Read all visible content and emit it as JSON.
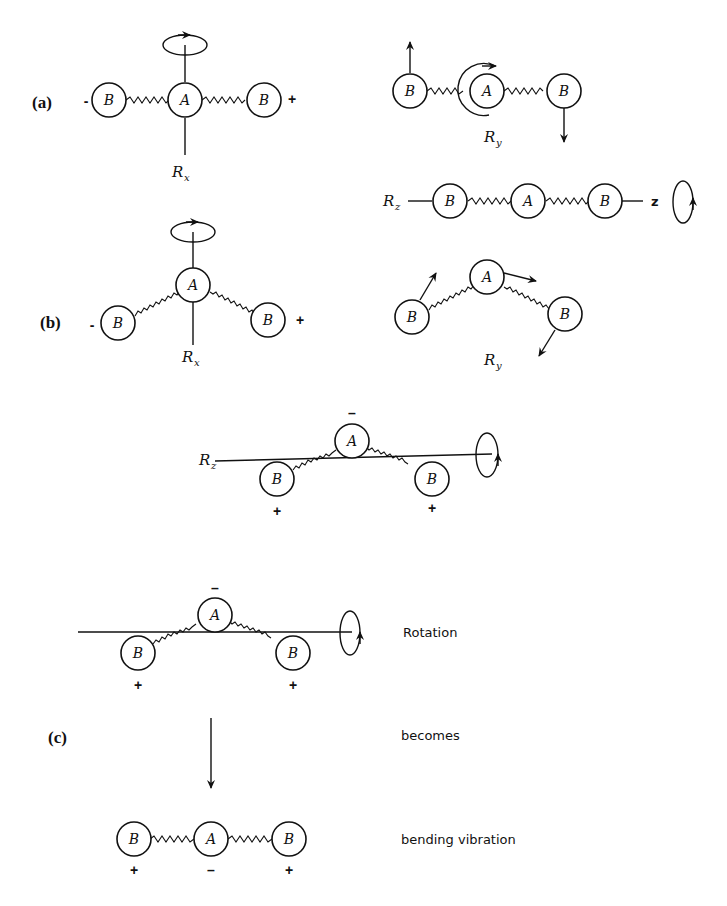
{
  "figure": {
    "parts": {
      "a": {
        "label": "(a)"
      },
      "b": {
        "label": "(b)"
      },
      "c": {
        "label": "(c)"
      }
    },
    "atoms": {
      "central": "A",
      "terminal": "B"
    },
    "signs": {
      "plus": "+",
      "minus": "-",
      "minus_bar": "–"
    },
    "axes": {
      "rx": {
        "main": "R",
        "sub": "x"
      },
      "ry": {
        "main": "R",
        "sub": "y"
      },
      "rz": {
        "main": "R",
        "sub": "z"
      },
      "z": "z"
    },
    "captions": {
      "rotation": "Rotation",
      "becomes": "becomes",
      "bending": "bending vibration"
    }
  }
}
